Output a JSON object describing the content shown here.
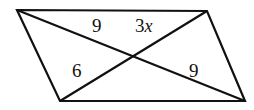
{
  "figure": {
    "shape": "parallelogram",
    "stroke_color": "#111111",
    "fill_color": "#ffffff",
    "background_color": "#ffffff",
    "stroke_width": 2.2,
    "vertices": {
      "top_left": {
        "x": 17,
        "y": 10
      },
      "top_right": {
        "x": 207,
        "y": 11
      },
      "bottom_right": {
        "x": 245,
        "y": 101
      },
      "bottom_left": {
        "x": 60,
        "y": 101
      }
    },
    "diagonal_intersection": {
      "x": 132,
      "y": 57
    },
    "labels": {
      "top_left_segment": "9",
      "top_right_segment_coefficient": "3",
      "top_right_segment_variable": "x",
      "bottom_left_segment": "6",
      "bottom_right_segment": "9"
    }
  }
}
